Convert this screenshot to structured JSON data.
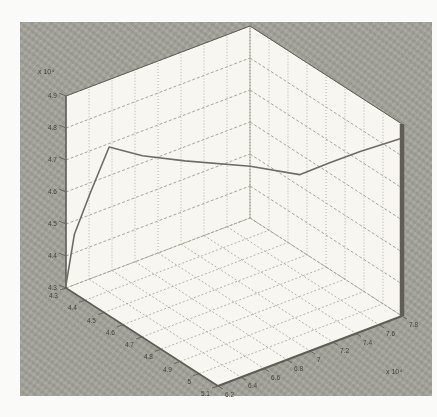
{
  "figure": {
    "page_bg": "#fafaf8",
    "panel_bg": "#a3a29a",
    "plot_face": "#f7f6f0",
    "grid_color": "#a5a396",
    "zgrid_color": "#94927f",
    "edge_color": "#5f5d55",
    "tick_label_color": "#403e38",
    "line_color": "#6e6c64"
  },
  "chart_data": {
    "type": "line",
    "projection": "3d",
    "title": "",
    "xlabel": "",
    "ylabel": "",
    "zlabel": "",
    "grid": true,
    "legend": null,
    "x_range": [
      4.3,
      5.1
    ],
    "y_range": [
      6.2,
      7.8
    ],
    "z_range": [
      4.3,
      4.9
    ],
    "x_ticks": [
      "4.3",
      "4.4",
      "4.5",
      "4.6",
      "4.7",
      "4.8",
      "4.9",
      "5",
      "5.1"
    ],
    "y_ticks": [
      "6.2",
      "6.4",
      "6.6",
      "6.8",
      "7",
      "7.2",
      "7.4",
      "7.6",
      "7.8"
    ],
    "z_ticks": [
      "4.3",
      "4.4",
      "4.5",
      "4.6",
      "4.7",
      "4.8",
      "4.9"
    ],
    "y_scale_label": "x 10⁴",
    "z_scale_label": "x 10⁴",
    "series": [
      {
        "name": "trajectory",
        "points": [
          {
            "x": 4.3,
            "y": 6.2,
            "z": 4.31
          },
          {
            "x": 4.32,
            "y": 6.24,
            "z": 4.47
          },
          {
            "x": 4.35,
            "y": 6.33,
            "z": 4.6
          },
          {
            "x": 4.4,
            "y": 6.41,
            "z": 4.75
          },
          {
            "x": 4.46,
            "y": 6.6,
            "z": 4.72
          },
          {
            "x": 4.52,
            "y": 6.87,
            "z": 4.69
          },
          {
            "x": 4.61,
            "y": 7.29,
            "z": 4.65
          },
          {
            "x": 4.7,
            "y": 7.57,
            "z": 4.62
          },
          {
            "x": 4.78,
            "y": 7.7,
            "z": 4.67
          },
          {
            "x": 4.88,
            "y": 7.8,
            "z": 4.73
          },
          {
            "x": 5.09,
            "y": 7.8,
            "z": 4.85
          }
        ]
      }
    ]
  }
}
